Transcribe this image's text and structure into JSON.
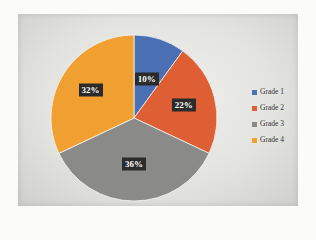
{
  "chart_data": {
    "type": "pie",
    "title": "",
    "categories": [
      "Grade 1",
      "Grade 2",
      "Grade 3",
      "Grade 4"
    ],
    "values": [
      10,
      22,
      36,
      32
    ],
    "labels": [
      "10%",
      "22%",
      "36%",
      "32%"
    ],
    "colors": [
      "#4a6fb3",
      "#de5f34",
      "#8a8a88",
      "#f0a030"
    ],
    "start_angle": "12 o'clock",
    "direction": "clockwise",
    "legend_position": "right",
    "data_labels": "percentage, dark box"
  },
  "legend": {
    "items": [
      {
        "label": "Grade 1",
        "color": "#4a6fb3"
      },
      {
        "label": "Grade 2",
        "color": "#de5f34"
      },
      {
        "label": "Grade 3",
        "color": "#8a8a88"
      },
      {
        "label": "Grade 4",
        "color": "#f0a030"
      }
    ]
  }
}
